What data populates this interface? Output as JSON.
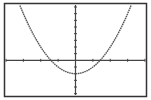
{
  "chart_data": {
    "type": "line",
    "title": "",
    "xlabel": "",
    "ylabel": "",
    "function": "y = x^2 - 2",
    "xlim": [
      -4,
      4
    ],
    "ylim": [
      -5.2,
      8.3
    ],
    "xscl": 1,
    "yscl": 1,
    "grid": false,
    "legend": null,
    "series": [
      {
        "name": "Y1",
        "x": [
          -3.2,
          -3,
          -2.5,
          -2,
          -1.5,
          -1.41,
          -1,
          -0.5,
          0,
          0.5,
          1,
          1.41,
          1.5,
          2,
          2.5,
          3,
          3.2
        ],
        "y": [
          8.24,
          7,
          4.25,
          2,
          0.25,
          0,
          -1,
          -1.75,
          -2,
          -1.75,
          -1,
          0,
          0.25,
          2,
          4.25,
          7,
          8.24
        ]
      }
    ],
    "annotations": {
      "vertex": [
        0,
        -2
      ],
      "x_intercepts": [
        -1.41,
        1.41
      ]
    }
  },
  "screen": {
    "frame_color": "#333333",
    "axis_color": "#444444",
    "curve_color": "#555555",
    "background": "#ffffff"
  }
}
